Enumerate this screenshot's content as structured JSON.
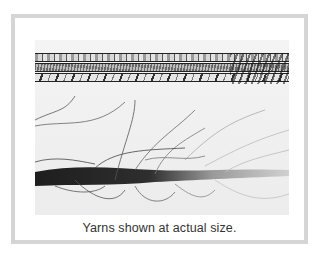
{
  "figure": {
    "image_alt": "Photograph of ribbon yarns and a brushed, fuzzy yarn",
    "caption": "Yarns shown at actual size.",
    "frame_color": "#d5d5d5",
    "caption_color": "#333333"
  }
}
